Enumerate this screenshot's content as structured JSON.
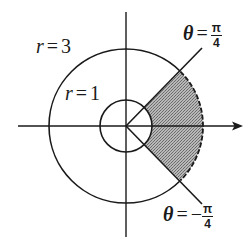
{
  "diagram": {
    "type": "polar-region",
    "colors": {
      "stroke": "#1a1a1a",
      "shade": "#9a9a9a",
      "background": "#ffffff"
    },
    "geometry": {
      "center": [
        126,
        126
      ],
      "inner_radius_px": 26,
      "outer_radius_px": 77,
      "ray_length_px": 108,
      "theta_start_deg": -45,
      "theta_end_deg": 45
    },
    "labels": {
      "outer_circle": {
        "var": "r",
        "eq": "=",
        "value": "3"
      },
      "inner_circle": {
        "var": "r",
        "eq": "=",
        "value": "1"
      },
      "upper_ray": {
        "var": "θ",
        "eq": "=",
        "sign": "",
        "numerator": "π",
        "denominator": "4"
      },
      "lower_ray": {
        "var": "θ",
        "eq": "=",
        "sign": "−",
        "numerator": "π",
        "denominator": "4"
      }
    },
    "elements": {
      "x_axis": "horizontal axis with arrowhead pointing right",
      "y_axis": "vertical axis without arrowhead",
      "outer_circle": "r = 3, solid except dashed arc on shaded region",
      "inner_circle": "r = 1, solid",
      "shaded_region": "annular sector 1 <= r <= 3, -pi/4 <= theta <= pi/4"
    }
  }
}
